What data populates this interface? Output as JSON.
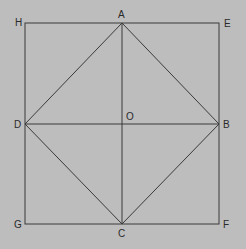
{
  "diagram": {
    "background": "#bdbdbd",
    "line_color": "#3a3a3a",
    "points": {
      "H": {
        "x": 25,
        "y": 23
      },
      "A": {
        "x": 122,
        "y": 23
      },
      "E": {
        "x": 219,
        "y": 23
      },
      "D": {
        "x": 25,
        "y": 124
      },
      "O": {
        "x": 122,
        "y": 124
      },
      "B": {
        "x": 219,
        "y": 124
      },
      "G": {
        "x": 25,
        "y": 224
      },
      "C": {
        "x": 122,
        "y": 224
      },
      "F": {
        "x": 219,
        "y": 224
      }
    },
    "labels": {
      "H": "H",
      "A": "A",
      "E": "E",
      "D": "D",
      "O": "O",
      "B": "B",
      "G": "G",
      "C": "C",
      "F": "F"
    },
    "segments": [
      [
        "H",
        "E"
      ],
      [
        "E",
        "F"
      ],
      [
        "F",
        "G"
      ],
      [
        "G",
        "H"
      ],
      [
        "A",
        "B"
      ],
      [
        "B",
        "C"
      ],
      [
        "C",
        "D"
      ],
      [
        "D",
        "A"
      ],
      [
        "A",
        "C"
      ],
      [
        "D",
        "B"
      ]
    ]
  }
}
